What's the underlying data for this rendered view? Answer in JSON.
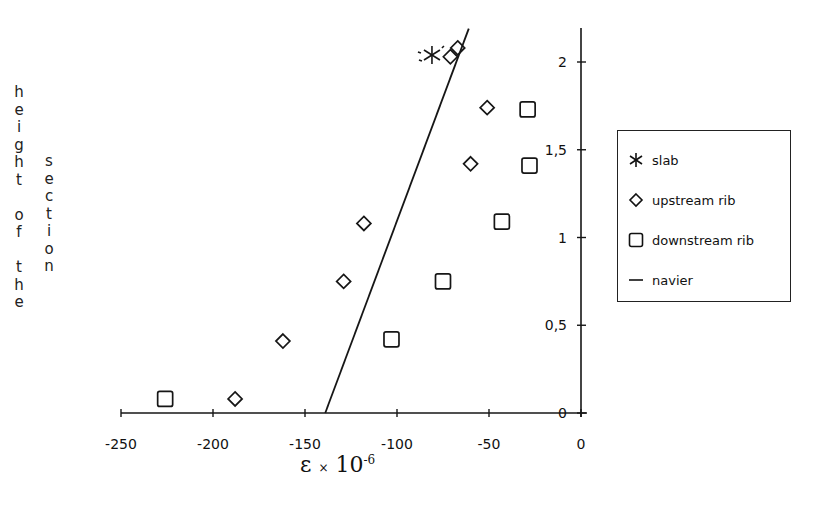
{
  "chart_data": {
    "type": "scatter",
    "title": "",
    "xlabel": "ε × 10^-6",
    "xlabel_parts": {
      "epsilon": "ε",
      "times": "×",
      "base": "10",
      "exp": "-6"
    },
    "ylabel_col1": "height of the",
    "ylabel_col2": "section",
    "xlim": [
      -250,
      0
    ],
    "ylim": [
      0,
      2.2
    ],
    "x_ticks": [
      -250,
      -200,
      -150,
      -100,
      -50,
      0
    ],
    "x_tick_labels": [
      "-250",
      "-200",
      "-150",
      "-100",
      "-50",
      "0"
    ],
    "y_ticks": [
      0,
      0.5,
      1,
      1.5,
      2
    ],
    "y_tick_labels": [
      "0",
      "0,5",
      "1",
      "1,5",
      "2"
    ],
    "y_axis_position": "right",
    "grid": false,
    "legend_position": "right",
    "series": [
      {
        "name": "slab",
        "marker": "asterisk",
        "points": [
          {
            "x": -81,
            "y": 2.04
          }
        ]
      },
      {
        "name": "upstream rib",
        "marker": "diamond",
        "points": [
          {
            "x": -188,
            "y": 0.08
          },
          {
            "x": -162,
            "y": 0.41
          },
          {
            "x": -129,
            "y": 0.75
          },
          {
            "x": -118,
            "y": 1.08
          },
          {
            "x": -60,
            "y": 1.42
          },
          {
            "x": -51,
            "y": 1.74
          },
          {
            "x": -71,
            "y": 2.03
          },
          {
            "x": -67,
            "y": 2.08
          }
        ]
      },
      {
        "name": "downstream rib",
        "marker": "square",
        "points": [
          {
            "x": -226,
            "y": 0.08
          },
          {
            "x": -103,
            "y": 0.42
          },
          {
            "x": -75,
            "y": 0.75
          },
          {
            "x": -43,
            "y": 1.09
          },
          {
            "x": -28,
            "y": 1.41
          },
          {
            "x": -29,
            "y": 1.73
          }
        ]
      },
      {
        "name": "navier",
        "marker": "line",
        "points": [
          {
            "x": -139,
            "y": 0
          },
          {
            "x": -61,
            "y": 2.19
          }
        ]
      }
    ]
  },
  "legend": {
    "items": [
      {
        "label": "slab",
        "symbol": "asterisk"
      },
      {
        "label": "upstream rib",
        "symbol": "diamond"
      },
      {
        "label": "downstream rib",
        "symbol": "square"
      },
      {
        "label": "navier",
        "symbol": "line"
      }
    ]
  }
}
